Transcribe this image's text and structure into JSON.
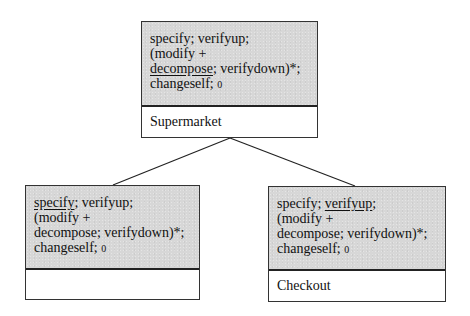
{
  "diagram": {
    "nodes": {
      "top": {
        "lines": [
          {
            "parts": [
              {
                "text": "specify; verifyup;",
                "underline": false
              }
            ]
          },
          {
            "parts": [
              {
                "text": "(modify +",
                "underline": false
              }
            ]
          },
          {
            "parts": [
              {
                "text": "decompose",
                "underline": true
              },
              {
                "text": "; verifydown)*;",
                "underline": false
              }
            ]
          },
          {
            "parts": [
              {
                "text": "changeself; ",
                "underline": false
              },
              {
                "text": "0",
                "small": true
              }
            ]
          }
        ],
        "name": "Supermarket"
      },
      "left": {
        "lines": [
          {
            "parts": [
              {
                "text": "specify",
                "underline": true
              },
              {
                "text": "; verifyup;",
                "underline": false
              }
            ]
          },
          {
            "parts": [
              {
                "text": "(modify +",
                "underline": false
              }
            ]
          },
          {
            "parts": [
              {
                "text": "decompose; verifydown)*;",
                "underline": false
              }
            ]
          },
          {
            "parts": [
              {
                "text": "changeself; ",
                "underline": false
              },
              {
                "text": "0",
                "small": true
              }
            ]
          }
        ],
        "name": ""
      },
      "right": {
        "lines": [
          {
            "parts": [
              {
                "text": "specify; ",
                "underline": false
              },
              {
                "text": "verifyup",
                "underline": true
              },
              {
                "text": ";",
                "underline": false
              }
            ]
          },
          {
            "parts": [
              {
                "text": "(modify +",
                "underline": false
              }
            ]
          },
          {
            "parts": [
              {
                "text": "decompose; verifydown)*;",
                "underline": false
              }
            ]
          },
          {
            "parts": [
              {
                "text": "changeself; ",
                "underline": false
              },
              {
                "text": "0",
                "small": true
              }
            ]
          }
        ],
        "name": "Checkout"
      }
    },
    "edges": [
      {
        "from": "top",
        "to": "left"
      },
      {
        "from": "top",
        "to": "right"
      }
    ],
    "colors": {
      "behavior_fill": "#d7d7d7",
      "border": "#333333",
      "line": "#222222"
    }
  }
}
